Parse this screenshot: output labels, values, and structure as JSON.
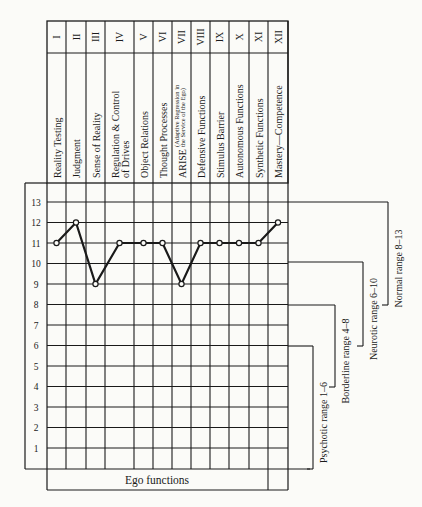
{
  "page": {
    "running_head": "Psychosis Assessment & Ego Function Rating"
  },
  "columns": [
    {
      "numeral": "I",
      "label": "Reality Testing",
      "label2": "",
      "x0": 47,
      "x1": 66
    },
    {
      "numeral": "II",
      "label": "Judgment",
      "label2": "",
      "x0": 66,
      "x1": 86
    },
    {
      "numeral": "III",
      "label": "Sense of Reality",
      "label2": "",
      "x0": 86,
      "x1": 105
    },
    {
      "numeral": "IV",
      "label": "Regulation & Control",
      "label2": "of Drives",
      "x0": 105,
      "x1": 134
    },
    {
      "numeral": "V",
      "label": "Object Relations",
      "label2": "",
      "x0": 134,
      "x1": 153
    },
    {
      "numeral": "VI",
      "label": "Thought Processes",
      "label2": "",
      "x0": 153,
      "x1": 172
    },
    {
      "numeral": "VII",
      "label": "ARISE",
      "label2": "(Adaptive Regression in|the Service of the Ego)",
      "x0": 172,
      "x1": 191
    },
    {
      "numeral": "VIII",
      "label": "Defensive Functions",
      "label2": "",
      "x0": 191,
      "x1": 210
    },
    {
      "numeral": "IX",
      "label": "Stimulus Barrier",
      "label2": "",
      "x0": 210,
      "x1": 229
    },
    {
      "numeral": "X",
      "label": "Autonomous Functions",
      "label2": "",
      "x0": 229,
      "x1": 249
    },
    {
      "numeral": "XI",
      "label": "Synthetic Functions",
      "label2": "",
      "x0": 249,
      "x1": 268
    },
    {
      "numeral": "XII",
      "label": "Mastery—Competence",
      "label2": "",
      "x0": 268,
      "x1": 288
    }
  ],
  "chart_data": {
    "type": "line",
    "xlabel": "Ego functions",
    "ylabel": "",
    "categories": [
      "I",
      "II",
      "III",
      "IV",
      "V",
      "VI",
      "VII",
      "VIII",
      "IX",
      "X",
      "XI",
      "XII"
    ],
    "category_labels": [
      "Reality Testing",
      "Judgment",
      "Sense of Reality",
      "Regulation & Control of Drives",
      "Object Relations",
      "Thought Processes",
      "ARISE (Adaptive Regression in the Service of the Ego)",
      "Defensive Functions",
      "Stimulus Barrier",
      "Autonomous Functions",
      "Synthetic Functions",
      "Mastery—Competence"
    ],
    "values": [
      11,
      12,
      9,
      11,
      11,
      11,
      9,
      11,
      11,
      11,
      11,
      12
    ],
    "ylim": [
      0,
      13
    ],
    "yticks": [
      1,
      2,
      3,
      4,
      5,
      6,
      7,
      8,
      9,
      10,
      11,
      12,
      13
    ],
    "grid": true,
    "annotations": [
      {
        "label": "Normal range 8–13",
        "from": 8,
        "to": 13
      },
      {
        "label": "Neurotic range 6–10",
        "from": 6,
        "to": 10
      },
      {
        "label": "Borderline range 4–8",
        "from": 4,
        "to": 8
      },
      {
        "label": "Psychotic range 1–6",
        "from": 1,
        "to": 6
      }
    ]
  },
  "ranges": [
    {
      "label": "Normal range 8–13",
      "top_y": 202,
      "bottom_y": 305,
      "x": 388,
      "text_x": 402
    },
    {
      "label": "Neurotic range 6–10",
      "top_y": 262,
      "bottom_y": 346,
      "x": 363,
      "text_x": 377
    },
    {
      "label": "Borderline range 4–8",
      "top_y": 305,
      "bottom_y": 387,
      "x": 335,
      "text_x": 349
    },
    {
      "label": "Psychotic range 1–6",
      "top_y": 346,
      "bottom_y": 469,
      "x": 313,
      "text_x": 327
    }
  ],
  "colors": {
    "ink": "#1a1a1a",
    "paper": "#fbfbf8"
  }
}
